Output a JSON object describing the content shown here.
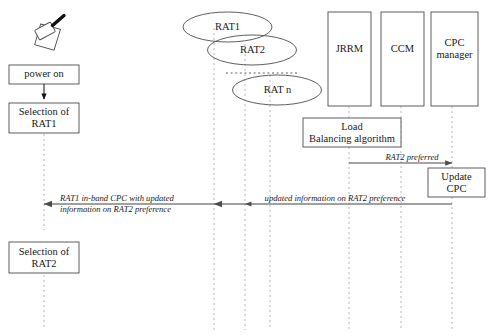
{
  "diagram": {
    "type": "sequence-diagram",
    "actors": [
      {
        "id": "terminal",
        "label": "",
        "lifeline_x": 44,
        "icon": "mobile-phone-icon"
      },
      {
        "id": "rat1",
        "label": "RAT1",
        "lifeline_x": 214
      },
      {
        "id": "rat2",
        "label": "RAT2",
        "lifeline_x": 245
      },
      {
        "id": "ratn",
        "label": "RAT n",
        "lifeline_x": 270
      },
      {
        "id": "jrrm",
        "label": "JRRM",
        "lifeline_x": 349
      },
      {
        "id": "ccm",
        "label": "CCM",
        "lifeline_x": 401
      },
      {
        "id": "cpc",
        "label": "CPC\nmanager",
        "lifeline_x": 452
      }
    ],
    "boxes": {
      "power_on": "power on",
      "selection_rat1": "Selection of\nRAT1",
      "selection_rat2": "Selection of\nRAT2",
      "load_balancing": "Load\nBalancing algorithm",
      "update_cpc": "Update\nCPC"
    },
    "ellipses": {
      "rat1": "RAT1",
      "rat2": "RAT2",
      "ratn": "RAT n"
    },
    "network_nodes": {
      "jrrm": "JRRM",
      "ccm": "CCM",
      "cpc_manager": "CPC\nmanager"
    },
    "messages": [
      {
        "id": "rat2-preferred",
        "label": "RAT2 preferred",
        "from": "jrrm",
        "to": "cpc",
        "direction": "right",
        "y": 163
      },
      {
        "id": "updated-information",
        "label": "updated information on RAT2 preference",
        "from": "cpc",
        "to": "rat1",
        "direction": "left",
        "y": 204
      },
      {
        "id": "rat1-in-band-cpc",
        "label": "RAT1 in-band CPC with updated\ninformation on RAT2 preference",
        "from": "rat1",
        "to": "terminal",
        "direction": "left",
        "y": 204
      }
    ],
    "colors": {
      "stroke": "#4d4d4d",
      "lifeline": "#b8b8b8",
      "text": "#1a1a1a",
      "background": "#ffffff",
      "phone_antenna": "#111111"
    }
  }
}
